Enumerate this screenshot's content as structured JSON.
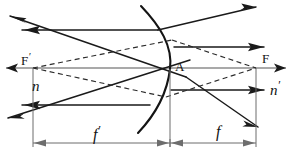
{
  "figure": {
    "type": "optics-ray-diagram"
  },
  "labels": {
    "focal_point_left": "F",
    "focal_point_left_prime": "′",
    "focal_point_right": "F",
    "vertex": "A",
    "index_left": "n",
    "index_right": "n",
    "index_right_prime": "′",
    "focal_length_left": "f",
    "focal_length_left_prime": "′",
    "focal_length_right": "f"
  },
  "geometry": {
    "axis_y": 68,
    "vertex_x": 170,
    "focal_left_x": 33,
    "focal_right_x": 256,
    "dimension_line_y": 143,
    "surface_radius": 120
  },
  "colors": {
    "ray_solid": "#1a1a1a",
    "ray_dashed": "#2b2b2b",
    "axis": "#555555",
    "surface": "#141414",
    "dimension": "#6d6d6d",
    "background": "#ffffff"
  }
}
